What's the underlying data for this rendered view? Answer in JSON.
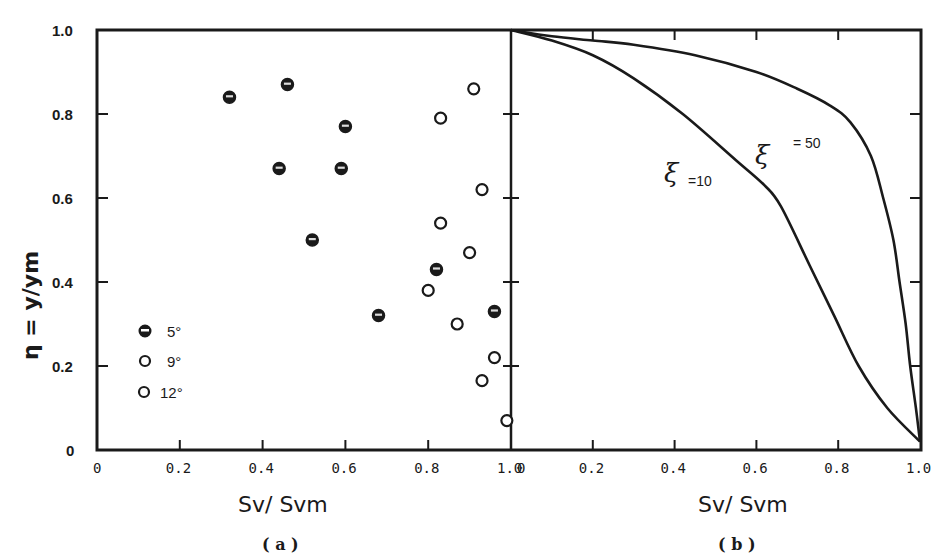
{
  "chart_data": [
    {
      "panel": "(a)",
      "type": "scatter",
      "title": "",
      "xlabel": "Sv/ Svm",
      "ylabel": "η = y/ym",
      "xlim": [
        0,
        1.0
      ],
      "ylim": [
        0,
        1.0
      ],
      "xticks": [
        "0",
        "0.2",
        "0.4",
        "0.6",
        "0.8",
        "1.0"
      ],
      "yticks": [
        "0",
        "0.2",
        "0.4",
        "0.6",
        "0.8",
        "1.0"
      ],
      "grid": false,
      "legend_position": "lower left",
      "legend": [
        {
          "name": "5°",
          "marker": "half-filled"
        },
        {
          "name": "9°",
          "marker": "open"
        },
        {
          "name": "12°",
          "marker": "open"
        }
      ],
      "series": [
        {
          "name": "5°",
          "marker": "half-filled",
          "points": [
            {
              "x": 0.32,
              "y": 0.84
            },
            {
              "x": 0.46,
              "y": 0.87
            },
            {
              "x": 0.6,
              "y": 0.77
            },
            {
              "x": 0.44,
              "y": 0.67
            },
            {
              "x": 0.59,
              "y": 0.67
            },
            {
              "x": 0.52,
              "y": 0.5
            },
            {
              "x": 0.68,
              "y": 0.32
            },
            {
              "x": 0.82,
              "y": 0.43
            },
            {
              "x": 0.96,
              "y": 0.33
            }
          ]
        },
        {
          "name": "9° / 12°",
          "marker": "open",
          "points": [
            {
              "x": 0.91,
              "y": 0.86
            },
            {
              "x": 0.83,
              "y": 0.79
            },
            {
              "x": 0.93,
              "y": 0.62
            },
            {
              "x": 0.83,
              "y": 0.54
            },
            {
              "x": 0.9,
              "y": 0.47
            },
            {
              "x": 0.8,
              "y": 0.38
            },
            {
              "x": 0.87,
              "y": 0.3
            },
            {
              "x": 0.96,
              "y": 0.22
            },
            {
              "x": 0.93,
              "y": 0.165
            },
            {
              "x": 0.99,
              "y": 0.07
            }
          ]
        }
      ]
    },
    {
      "panel": "(b)",
      "type": "line",
      "title": "",
      "xlabel": "Sv/ Svm",
      "ylabel": "",
      "xlim": [
        0,
        1.0
      ],
      "ylim": [
        0,
        1.0
      ],
      "xticks": [
        "0",
        "0.2",
        "0.4",
        "0.6",
        "0.8",
        "1.0"
      ],
      "grid": false,
      "series": [
        {
          "name": "ξ = 10",
          "points": [
            {
              "x": 0.0,
              "y": 1.0
            },
            {
              "x": 0.1,
              "y": 0.975
            },
            {
              "x": 0.2,
              "y": 0.94
            },
            {
              "x": 0.3,
              "y": 0.885
            },
            {
              "x": 0.42,
              "y": 0.8
            },
            {
              "x": 0.55,
              "y": 0.69
            },
            {
              "x": 0.62,
              "y": 0.63
            },
            {
              "x": 0.66,
              "y": 0.58
            },
            {
              "x": 0.73,
              "y": 0.44
            },
            {
              "x": 0.79,
              "y": 0.32
            },
            {
              "x": 0.85,
              "y": 0.2
            },
            {
              "x": 0.92,
              "y": 0.1
            },
            {
              "x": 1.0,
              "y": 0.02
            }
          ]
        },
        {
          "name": "ξ = 50",
          "points": [
            {
              "x": 0.0,
              "y": 1.0
            },
            {
              "x": 0.1,
              "y": 0.985
            },
            {
              "x": 0.2,
              "y": 0.975
            },
            {
              "x": 0.3,
              "y": 0.965
            },
            {
              "x": 0.45,
              "y": 0.94
            },
            {
              "x": 0.6,
              "y": 0.9
            },
            {
              "x": 0.7,
              "y": 0.86
            },
            {
              "x": 0.78,
              "y": 0.82
            },
            {
              "x": 0.83,
              "y": 0.78
            },
            {
              "x": 0.88,
              "y": 0.7
            },
            {
              "x": 0.91,
              "y": 0.6
            },
            {
              "x": 0.935,
              "y": 0.5
            },
            {
              "x": 0.95,
              "y": 0.4
            },
            {
              "x": 0.965,
              "y": 0.3
            },
            {
              "x": 0.976,
              "y": 0.2
            },
            {
              "x": 0.99,
              "y": 0.1
            },
            {
              "x": 1.0,
              "y": 0.02
            }
          ]
        }
      ],
      "annotations": [
        {
          "text": "ξ",
          "suffix": "=10",
          "x": 0.4,
          "y": 0.6
        },
        {
          "text": "ξ",
          "suffix": "= 50",
          "x": 0.6,
          "y": 0.68
        }
      ]
    }
  ],
  "labels": {
    "panel_a": "( a )",
    "panel_b": "( b )",
    "xlabel_a": "Sv/ Svm",
    "xlabel_b": "Sv/ Svm",
    "ylabel": "η = y/ym",
    "legend_5": "5°",
    "legend_9": "9°",
    "legend_12": "12°",
    "curve_10_sym": "ξ",
    "curve_10_val": "=10",
    "curve_50_sym": "ξ",
    "curve_50_val": "= 50"
  },
  "colors": {
    "ink": "#1a1a1a",
    "background": "#ffffff"
  }
}
